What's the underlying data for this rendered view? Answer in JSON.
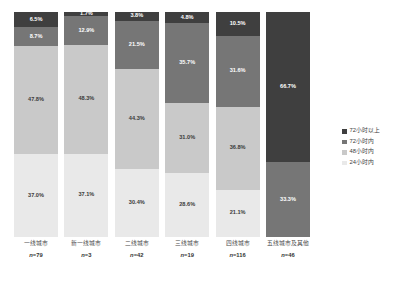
{
  "chart_data": {
    "type": "bar",
    "title": "",
    "subtitle": "",
    "xlabel": "",
    "ylabel": "",
    "stacked": true,
    "normalized_100pct": true,
    "ylim": [
      0,
      100
    ],
    "grid": false,
    "legend_position": "right",
    "categories": [
      "一线城市",
      "新一线城市",
      "二线城市",
      "三线城市",
      "四线城市",
      "五线城市及其他"
    ],
    "category_counts": [
      "n=79",
      "n=3",
      "n=42",
      "n=19",
      "n=116",
      "n=46"
    ],
    "series": [
      {
        "name": "72小时以上",
        "color": "#3f3f3f",
        "values": [
          6.5,
          1.7,
          3.8,
          4.8,
          10.5,
          66.7
        ],
        "labels": [
          "6.5%",
          "1.7%",
          "3.8%",
          "4.8%",
          "10.5%",
          "66.7%"
        ]
      },
      {
        "name": "72小时内",
        "color": "#767676",
        "values": [
          8.7,
          12.9,
          21.5,
          35.7,
          31.6,
          33.3
        ],
        "labels": [
          "8.7%",
          "12.9%",
          "21.5%",
          "35.7%",
          "31.6%",
          "33.3%"
        ]
      },
      {
        "name": "48小时内",
        "color": "#c9c9c9",
        "values": [
          47.8,
          48.3,
          44.3,
          31.0,
          36.8,
          0
        ],
        "labels": [
          "47.8%",
          "48.3%",
          "44.3%",
          "31.0%",
          "36.8%",
          ""
        ]
      },
      {
        "name": "24小时内",
        "color": "#e9e9e9",
        "values": [
          37.0,
          37.1,
          30.4,
          28.6,
          21.1,
          0
        ],
        "labels": [
          "37.0%",
          "37.1%",
          "30.4%",
          "28.6%",
          "21.1%",
          ""
        ]
      }
    ],
    "legend_entries": [
      {
        "label": "72小时以上",
        "color": "#3f3f3f"
      },
      {
        "label": "72小时内",
        "color": "#767676"
      },
      {
        "label": "48小时内",
        "color": "#c9c9c9"
      },
      {
        "label": "24小时内",
        "color": "#e9e9e9"
      }
    ]
  }
}
